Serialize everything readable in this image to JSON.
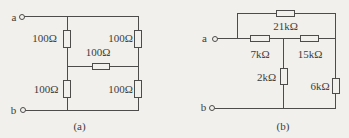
{
  "figure": {
    "colors": {
      "background": "#f1f0ed",
      "wire": "#4d4c4a",
      "text": "#3e3c39"
    }
  },
  "circuit_a": {
    "caption": "(a)",
    "terminal_top": "a",
    "terminal_bottom": "b",
    "resistors": {
      "upper_left": "100Ω",
      "upper_right": "100Ω",
      "middle": "100Ω",
      "lower_left": "100Ω",
      "lower_right": "100Ω"
    }
  },
  "circuit_b": {
    "caption": "(b)",
    "terminal_top": "a",
    "terminal_bottom": "b",
    "resistors": {
      "top": "21kΩ",
      "series_left": "7kΩ",
      "series_right": "15kΩ",
      "shunt_middle": "2kΩ",
      "shunt_right": "6kΩ"
    }
  }
}
